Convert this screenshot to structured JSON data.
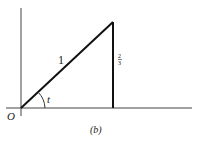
{
  "diagram": {
    "caption": "(b)",
    "origin_label": "O",
    "hypotenuse_label": "1",
    "angle_label": "t",
    "opposite_label_num": "2",
    "opposite_label_den": "3",
    "colors": {
      "line": "#222222",
      "background": "#ffffff"
    }
  }
}
